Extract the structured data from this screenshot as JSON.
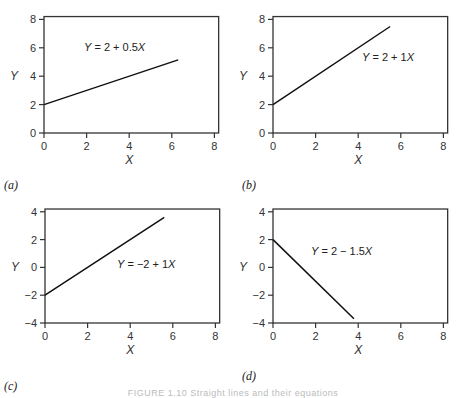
{
  "caption": "FIGURE 1.10  Straight lines and their equations",
  "chart_data": [
    {
      "type": "line",
      "panel_label": "(a)",
      "equation": "Y = 2 + 0.5X",
      "intercept": 2,
      "slope": 0.5,
      "x": [
        0,
        6.3
      ],
      "y": [
        2,
        5.15
      ],
      "xlabel": "X",
      "ylabel": "Y",
      "xlim": [
        0,
        8.2
      ],
      "ylim": [
        0,
        8.2
      ],
      "xticks": [
        0,
        2,
        4,
        6,
        8
      ],
      "yticks": [
        0,
        2,
        4,
        6,
        8
      ],
      "grid": false
    },
    {
      "type": "line",
      "panel_label": "(b)",
      "equation": "Y = 2 + 1X",
      "intercept": 2,
      "slope": 1,
      "x": [
        0,
        5.5
      ],
      "y": [
        2,
        7.5
      ],
      "xlabel": "X",
      "ylabel": "Y",
      "xlim": [
        0,
        8.2
      ],
      "ylim": [
        0,
        8.2
      ],
      "xticks": [
        0,
        2,
        4,
        6,
        8
      ],
      "yticks": [
        0,
        2,
        4,
        6,
        8
      ],
      "grid": false
    },
    {
      "type": "line",
      "panel_label": "(c)",
      "equation": "Y = −2 + 1X",
      "intercept": -2,
      "slope": 1,
      "x": [
        0,
        5.6
      ],
      "y": [
        -2,
        3.6
      ],
      "xlabel": "X",
      "ylabel": "Y",
      "xlim": [
        0,
        8.2
      ],
      "ylim": [
        -4,
        4.2
      ],
      "xticks": [
        0,
        2,
        4,
        6,
        8
      ],
      "yticks": [
        -4,
        -2,
        0,
        2,
        4
      ],
      "grid": false
    },
    {
      "type": "line",
      "panel_label": "(d)",
      "equation": "Y = 2 − 1.5X",
      "intercept": 2,
      "slope": -1.5,
      "x": [
        0,
        3.8
      ],
      "y": [
        2,
        -3.7
      ],
      "xlabel": "X",
      "ylabel": "Y",
      "xlim": [
        0,
        8.2
      ],
      "ylim": [
        -4,
        4.2
      ],
      "xticks": [
        0,
        2,
        4,
        6,
        8
      ],
      "yticks": [
        -4,
        -2,
        0,
        2,
        4
      ],
      "grid": false
    }
  ],
  "layout": [
    {
      "x0": 44,
      "y0": 133,
      "xs": 21.3,
      "ys": 14.2,
      "eqx": 84,
      "eqy": 51,
      "pl": [
        4,
        189
      ]
    },
    {
      "x0": 273,
      "y0": 133,
      "xs": 21.3,
      "ys": 14.2,
      "eqx": 362,
      "eqy": 61,
      "pl": [
        242,
        189
      ]
    },
    {
      "x0": 45,
      "y0": 323,
      "xs": 21.3,
      "ys": 13.9,
      "eqx": 117,
      "eqy": 268,
      "pl": [
        4,
        390
      ]
    },
    {
      "x0": 273,
      "y0": 323,
      "xs": 21.3,
      "ys": 13.9,
      "eqx": 311,
      "eqy": 255,
      "pl": [
        242,
        380
      ]
    }
  ]
}
